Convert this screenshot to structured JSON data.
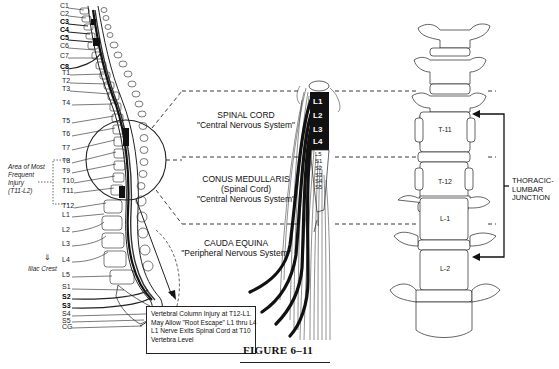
{
  "figure": {
    "caption": "FIGURE 6–11"
  },
  "left_spine": {
    "cervical_labels": [
      {
        "label": "C1",
        "y": 5,
        "bold": false
      },
      {
        "label": "C2",
        "y": 13,
        "bold": false
      },
      {
        "label": "C3",
        "y": 21,
        "bold": true
      },
      {
        "label": "C4",
        "y": 29,
        "bold": true
      },
      {
        "label": "C5",
        "y": 37,
        "bold": true
      },
      {
        "label": "C6",
        "y": 45,
        "bold": false
      },
      {
        "label": "C7",
        "y": 55,
        "bold": false
      },
      {
        "label": "C8",
        "y": 66,
        "bold": true
      }
    ],
    "thoracic_labels": [
      {
        "label": "T1",
        "y": 72
      },
      {
        "label": "T2",
        "y": 80
      },
      {
        "label": "T3",
        "y": 88
      },
      {
        "label": "T4",
        "y": 102
      },
      {
        "label": "T5",
        "y": 120
      },
      {
        "label": "T6",
        "y": 133
      },
      {
        "label": "T7",
        "y": 147
      },
      {
        "label": "T8",
        "y": 160
      },
      {
        "label": "T9",
        "y": 170
      },
      {
        "label": "T10",
        "y": 180
      },
      {
        "label": "T11",
        "y": 190
      },
      {
        "label": "T12",
        "y": 205
      }
    ],
    "lumbar_labels": [
      {
        "label": "L1",
        "y": 214
      },
      {
        "label": "L2",
        "y": 229
      },
      {
        "label": "L3",
        "y": 243
      },
      {
        "label": "L4",
        "y": 259
      },
      {
        "label": "L5",
        "y": 274
      }
    ],
    "sacral_labels": [
      {
        "label": "S1",
        "y": 286,
        "bold": false
      },
      {
        "label": "S2",
        "y": 296,
        "bold": true
      },
      {
        "label": "S3",
        "y": 305,
        "bold": true
      },
      {
        "label": "S4",
        "y": 313,
        "bold": false
      },
      {
        "label": "S5",
        "y": 320,
        "bold": false
      },
      {
        "label": "CG",
        "y": 326,
        "bold": false
      }
    ],
    "injury_area": {
      "line1": "Area of Most",
      "line2": "Frequent",
      "line3": "Injury",
      "line4": "(T11-L2)"
    },
    "iliac_crest": "Iliac Crest"
  },
  "callout": {
    "lines": [
      "Vertebral Column Injury at T12-L1.",
      "May Allow \"Root Escape\" L1 thru L4",
      "L1 Nerve Exits Spinal Cord at T10",
      "Vertebra Level"
    ]
  },
  "regions": {
    "spinal_cord": {
      "title": "SPINAL CORD",
      "subtitle": "\"Central Nervous System\""
    },
    "conus_medullaris": {
      "title": "CONUS MEDULLARIS",
      "subtitle": "(Spinal Cord)",
      "subtitle2": "\"Central Nervous System\""
    },
    "cauda_equina": {
      "title": "CAUDA EQUINA",
      "subtitle": "\"Peripheral Nervous System\""
    }
  },
  "cord_roots": {
    "lumbar": [
      "L1",
      "L2",
      "L3",
      "L4"
    ],
    "lower": [
      "L5",
      "S1",
      "S2",
      "S3",
      "S4",
      "S5"
    ]
  },
  "vertebrae": {
    "labels": [
      "T-11",
      "T-12",
      "L-1",
      "L-2"
    ]
  },
  "junction": {
    "line1": "THORACIC-",
    "line2": "LUMBAR",
    "line3": "JUNCTION"
  },
  "colors": {
    "ink": "#111111",
    "paper": "#ffffff"
  }
}
